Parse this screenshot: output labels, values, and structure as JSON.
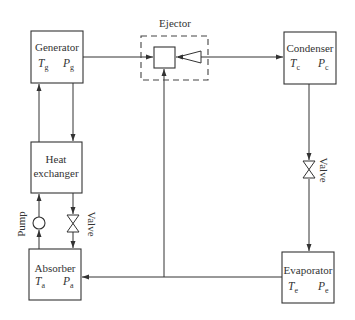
{
  "diagram": {
    "colors": {
      "stroke": "#333333",
      "background": "#ffffff"
    },
    "components": {
      "generator": {
        "label": "Generator",
        "t_var": "T",
        "t_sub": "g",
        "p_var": "P",
        "p_sub": "g"
      },
      "ejector": {
        "label": "Ejector"
      },
      "condenser": {
        "label": "Condenser",
        "t_var": "T",
        "t_sub": "c",
        "p_var": "P",
        "p_sub": "c"
      },
      "heat_exchanger": {
        "label_line1": "Heat",
        "label_line2": "exchanger"
      },
      "absorber": {
        "label": "Absorber",
        "t_var": "T",
        "t_sub": "a",
        "p_var": "P",
        "p_sub": "a"
      },
      "evaporator": {
        "label": "Evaporator",
        "t_var": "T",
        "t_sub": "e",
        "p_var": "P",
        "p_sub": "e"
      }
    },
    "labels": {
      "pump": "Pump",
      "valve_left": "Valve",
      "valve_right": "Valve"
    },
    "connections": [
      {
        "from": "Generator",
        "to": "Ejector"
      },
      {
        "from": "Ejector",
        "to": "Condenser"
      },
      {
        "from": "Condenser",
        "to": "Evaporator",
        "via": "Valve"
      },
      {
        "from": "Evaporator",
        "to": "Absorber"
      },
      {
        "from": "Evaporator line",
        "to": "Ejector (suction)"
      },
      {
        "from": "Absorber",
        "to": "Heat exchanger",
        "via": "Pump"
      },
      {
        "from": "Heat exchanger",
        "to": "Generator"
      },
      {
        "from": "Generator",
        "to": "Heat exchanger"
      },
      {
        "from": "Heat exchanger",
        "to": "Absorber",
        "via": "Valve"
      }
    ]
  }
}
